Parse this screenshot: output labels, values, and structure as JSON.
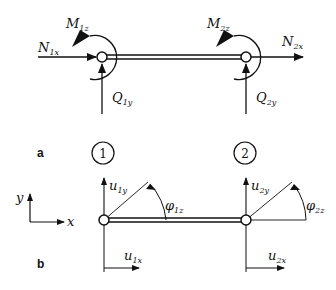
{
  "panel_a": {
    "label": "a",
    "node1": {
      "N": "N",
      "N_sub": "1x",
      "M": "M",
      "M_sub": "1z",
      "Q": "Q",
      "Q_sub": "1y"
    },
    "node2": {
      "N": "N",
      "N_sub": "2x",
      "M": "M",
      "M_sub": "2z",
      "Q": "Q",
      "Q_sub": "2y"
    }
  },
  "node_numbers": [
    "1",
    "2"
  ],
  "panel_b": {
    "label": "b",
    "axes": {
      "x": "x",
      "y": "y"
    },
    "node1": {
      "ux": "u",
      "ux_sub": "1x",
      "uy": "u",
      "uy_sub": "1y",
      "phi": "φ",
      "phi_sub": "1z"
    },
    "node2": {
      "ux": "u",
      "ux_sub": "2x",
      "uy": "u",
      "uy_sub": "2y",
      "phi": "φ",
      "phi_sub": "2z"
    }
  }
}
